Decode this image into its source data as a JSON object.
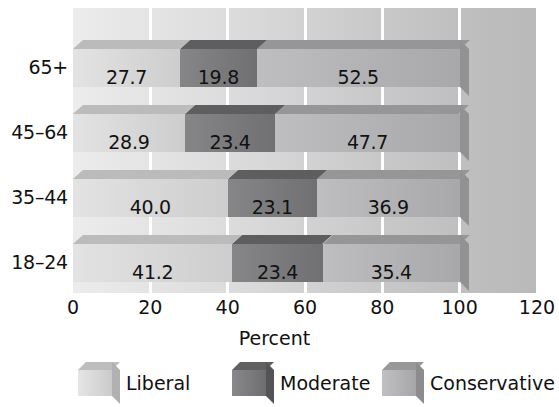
{
  "chart_data": {
    "type": "bar",
    "orientation": "horizontal",
    "stacked": true,
    "style": "3d",
    "title": "",
    "xlabel": "Percent",
    "ylabel": "",
    "xlim": [
      0,
      120
    ],
    "xticks": [
      "0",
      "20",
      "40",
      "60",
      "80",
      "100",
      "120"
    ],
    "grid": "vertical",
    "legend_position": "bottom",
    "categories": [
      "18–24",
      "35–44",
      "45–64",
      "65+"
    ],
    "series": [
      {
        "name": "Liberal",
        "color": "#d9d9da",
        "values": [
          41.2,
          40.0,
          28.9,
          27.7
        ],
        "labels": [
          "41.2",
          "40.0",
          "28.9",
          "27.7"
        ]
      },
      {
        "name": "Moderate",
        "color": "#7c7c7e",
        "values": [
          23.4,
          23.1,
          23.4,
          19.8
        ],
        "labels": [
          "23.4",
          "23.1",
          "23.4",
          "19.8"
        ]
      },
      {
        "name": "Conservative",
        "color": "#b4b4b6",
        "values": [
          35.4,
          36.9,
          47.7,
          52.5
        ],
        "labels": [
          "35.4",
          "36.9",
          "47.7",
          "52.5"
        ]
      }
    ],
    "rows": [
      {
        "category": "65+",
        "segments": [
          {
            "series": "Liberal",
            "value": 27.7,
            "label": "27.7"
          },
          {
            "series": "Moderate",
            "value": 19.8,
            "label": "19.8"
          },
          {
            "series": "Conservative",
            "value": 52.5,
            "label": "52.5"
          }
        ]
      },
      {
        "category": "45–64",
        "segments": [
          {
            "series": "Liberal",
            "value": 28.9,
            "label": "28.9"
          },
          {
            "series": "Moderate",
            "value": 23.4,
            "label": "23.4"
          },
          {
            "series": "Conservative",
            "value": 47.7,
            "label": "47.7"
          }
        ]
      },
      {
        "category": "35–44",
        "segments": [
          {
            "series": "Liberal",
            "value": 40.0,
            "label": "40.0"
          },
          {
            "series": "Moderate",
            "value": 23.1,
            "label": "23.1"
          },
          {
            "series": "Conservative",
            "value": 36.9,
            "label": "36.9"
          }
        ]
      },
      {
        "category": "18–24",
        "segments": [
          {
            "series": "Liberal",
            "value": 41.2,
            "label": "41.2"
          },
          {
            "series": "Moderate",
            "value": 23.4,
            "label": "23.4"
          },
          {
            "series": "Conservative",
            "value": 35.4,
            "label": "35.4"
          }
        ]
      }
    ],
    "legend": [
      {
        "label": "Liberal",
        "color": "#d9d9da"
      },
      {
        "label": "Moderate",
        "color": "#7c7c7e"
      },
      {
        "label": "Conservative",
        "color": "#b4b4b6"
      }
    ]
  },
  "colors": {
    "liberal": "#d9d9da",
    "moderate": "#7c7c7e",
    "conservative": "#b4b4b6",
    "plot_background_left": "#ececed",
    "plot_background_right": "#b9b9ba",
    "gridline": "#ffffff",
    "text": "#111111",
    "page_background": "#ffffff"
  }
}
